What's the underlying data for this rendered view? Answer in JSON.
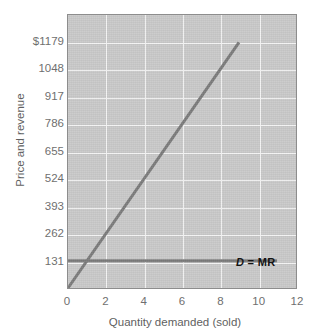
{
  "chart_data": {
    "type": "line",
    "title": "",
    "xlabel": "Quantity demanded (sold)",
    "ylabel": "Price and revenue",
    "xlim": [
      0,
      12
    ],
    "ylim": [
      0,
      1310
    ],
    "grid": true,
    "legend_position": "inline-annotation",
    "xticks": [
      {
        "value": 0,
        "label": "0"
      },
      {
        "value": 2,
        "label": "2"
      },
      {
        "value": 4,
        "label": "4"
      },
      {
        "value": 6,
        "label": "6"
      },
      {
        "value": 8,
        "label": "8"
      },
      {
        "value": 10,
        "label": "10"
      },
      {
        "value": 12,
        "label": "12"
      }
    ],
    "yticks": [
      {
        "value": 131,
        "label": "131"
      },
      {
        "value": 262,
        "label": "262"
      },
      {
        "value": 393,
        "label": "393"
      },
      {
        "value": 524,
        "label": "524"
      },
      {
        "value": 655,
        "label": "655"
      },
      {
        "value": 786,
        "label": "786"
      },
      {
        "value": 917,
        "label": "917"
      },
      {
        "value": 1048,
        "label": "1048"
      },
      {
        "value": 1179,
        "label": "$1179"
      }
    ],
    "series": [
      {
        "name": "TR",
        "label": "TR",
        "color": "#7a7a7a",
        "kind": "line",
        "points": [
          {
            "x": 0,
            "y": 0
          },
          {
            "x": 9,
            "y": 1179
          }
        ],
        "slope": 131,
        "annotation": "TR"
      },
      {
        "name": "D = MR",
        "label": "D = MR",
        "color": "#7a7a7a",
        "kind": "line",
        "points": [
          {
            "x": 0,
            "y": 131
          },
          {
            "x": 11,
            "y": 131
          }
        ],
        "slope": 0,
        "annotation": "D = MR",
        "annotation_parts": {
          "d": "D",
          "rest": " = MR"
        }
      }
    ],
    "colors": {
      "panel_background": "#c9c9c9",
      "gridline": "#f4f4f4",
      "axis_line": "#8d8d8d",
      "series_line": "#7a7a7a",
      "tick_label": "#6f6f6f",
      "axis_title": "#5f5f5f",
      "annotation": "#141414",
      "page_background": "#ffffff"
    }
  },
  "axes": {
    "y_title": "Price and revenue",
    "x_title": "Quantity demanded (sold)",
    "y_origin_label": "0"
  },
  "annotations": {
    "tr": "TR",
    "dmr_d": "D",
    "dmr_rest": " = MR"
  }
}
